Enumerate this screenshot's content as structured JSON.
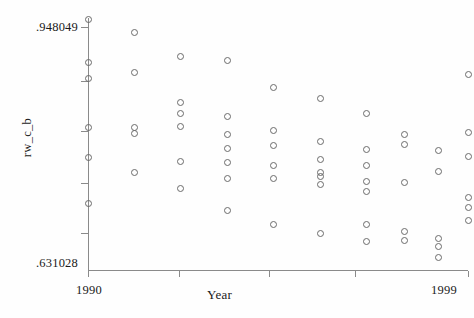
{
  "chart_data": {
    "type": "scatter",
    "title": "",
    "xlabel": "Year",
    "ylabel": "rw_c_b",
    "xlim": [
      1990,
      1999
    ],
    "ylim": [
      0.631028,
      0.948049
    ],
    "y_axis_min_label": ".631028",
    "y_axis_max_label": ".948049",
    "x_axis_min_label": "1990",
    "x_axis_max_label": "1999",
    "grid": false,
    "legend": "none",
    "marker_style": "open-circle",
    "marker_color": "#6b6b6b",
    "x_ticks": [
      1990,
      1992.16,
      1994.28,
      1996.33,
      1999
    ],
    "y_ticks": [
      0.93676,
      0.86875,
      0.8062,
      0.74038,
      0.67784
    ],
    "points": [
      {
        "x": 1990,
        "y": 0.94678
      },
      {
        "x": 1990,
        "y": 0.89144
      },
      {
        "x": 1990,
        "y": 0.87132
      },
      {
        "x": 1990,
        "y": 0.8097
      },
      {
        "x": 1990,
        "y": 0.77197
      },
      {
        "x": 1990,
        "y": 0.71412
      },
      {
        "x": 1991.1,
        "y": 0.93043
      },
      {
        "x": 1991.1,
        "y": 0.87886
      },
      {
        "x": 1991.1,
        "y": 0.8097
      },
      {
        "x": 1991.1,
        "y": 0.80216
      },
      {
        "x": 1991.1,
        "y": 0.7531
      },
      {
        "x": 1992.2,
        "y": 0.90024
      },
      {
        "x": 1992.2,
        "y": 0.84113
      },
      {
        "x": 1992.2,
        "y": 0.8273
      },
      {
        "x": 1992.2,
        "y": 0.81096
      },
      {
        "x": 1992.2,
        "y": 0.76693
      },
      {
        "x": 1992.2,
        "y": 0.73409
      },
      {
        "x": 1993.3,
        "y": 0.89521
      },
      {
        "x": 1993.3,
        "y": 0.82353
      },
      {
        "x": 1993.3,
        "y": 0.8009
      },
      {
        "x": 1993.3,
        "y": 0.7833
      },
      {
        "x": 1993.3,
        "y": 0.76567
      },
      {
        "x": 1993.3,
        "y": 0.74667
      },
      {
        "x": 1993.3,
        "y": 0.70532
      },
      {
        "x": 1994.4,
        "y": 0.86
      },
      {
        "x": 1994.4,
        "y": 0.80593
      },
      {
        "x": 1994.4,
        "y": 0.78707
      },
      {
        "x": 1994.4,
        "y": 0.7619
      },
      {
        "x": 1994.4,
        "y": 0.74667
      },
      {
        "x": 1994.4,
        "y": 0.6877
      },
      {
        "x": 1995.5,
        "y": 0.84616
      },
      {
        "x": 1995.5,
        "y": 0.7921
      },
      {
        "x": 1995.5,
        "y": 0.76944
      },
      {
        "x": 1995.5,
        "y": 0.7531
      },
      {
        "x": 1995.5,
        "y": 0.74918
      },
      {
        "x": 1995.5,
        "y": 0.73913
      },
      {
        "x": 1995.5,
        "y": 0.67637
      },
      {
        "x": 1996.6,
        "y": 0.8273
      },
      {
        "x": 1996.6,
        "y": 0.78204
      },
      {
        "x": 1996.6,
        "y": 0.7619
      },
      {
        "x": 1996.6,
        "y": 0.74289
      },
      {
        "x": 1996.6,
        "y": 0.73031
      },
      {
        "x": 1996.6,
        "y": 0.6877
      },
      {
        "x": 1996.6,
        "y": 0.6663
      },
      {
        "x": 1997.5,
        "y": 0.8009
      },
      {
        "x": 1997.5,
        "y": 0.78833
      },
      {
        "x": 1997.5,
        "y": 0.74163
      },
      {
        "x": 1997.5,
        "y": 0.67888
      },
      {
        "x": 1997.5,
        "y": 0.66756
      },
      {
        "x": 1998.3,
        "y": 0.78078
      },
      {
        "x": 1998.3,
        "y": 0.75436
      },
      {
        "x": 1998.3,
        "y": 0.67008
      },
      {
        "x": 1998.3,
        "y": 0.66002
      },
      {
        "x": 1998.3,
        "y": 0.6462
      },
      {
        "x": 1999,
        "y": 0.87635
      },
      {
        "x": 1999,
        "y": 0.80342
      },
      {
        "x": 1999,
        "y": 0.77322
      },
      {
        "x": 1999,
        "y": 0.72166
      },
      {
        "x": 1999,
        "y": 0.70909
      },
      {
        "x": 1999,
        "y": 0.69275
      }
    ]
  }
}
